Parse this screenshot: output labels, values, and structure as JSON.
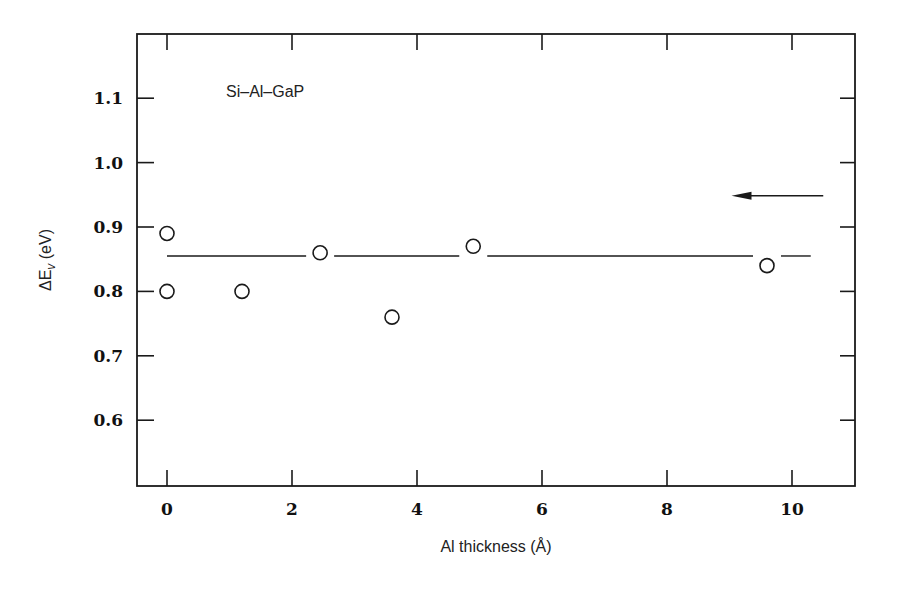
{
  "chart_data": {
    "type": "scatter",
    "title": "",
    "annotation": "Si–Al–GaP",
    "xlabel": "Al thickness (Å)",
    "ylabel_prefix": "ΔE",
    "ylabel_sub": "v",
    "ylabel_suffix": " (eV)",
    "xlim": [
      -0.5,
      11.0
    ],
    "ylim": [
      0.5,
      1.2
    ],
    "x_ticks": [
      0,
      2,
      4,
      6,
      8,
      10
    ],
    "x_tick_labels": [
      "0",
      "2",
      "4",
      "6",
      "8",
      "10"
    ],
    "y_ticks": [
      0.6,
      0.7,
      0.8,
      0.9,
      1.0,
      1.1
    ],
    "y_tick_labels": [
      "0.6",
      "0.7",
      "0.8",
      "0.9",
      "1.0",
      "1.1"
    ],
    "grid": false,
    "legend": null,
    "series": [
      {
        "name": "Si-Al-GaP",
        "marker": "open-circle",
        "x": [
          0.0,
          0.0,
          1.2,
          2.45,
          3.6,
          4.9,
          9.6
        ],
        "y": [
          0.89,
          0.8,
          0.8,
          0.86,
          0.76,
          0.87,
          0.84
        ]
      }
    ],
    "reference_line": {
      "type": "horizontal",
      "y": 0.855,
      "x_range": [
        0.0,
        10.3
      ],
      "style": "solid, broken around markers"
    },
    "arrow": {
      "direction": "left",
      "y": 0.95,
      "x_from": 10.5,
      "x_to": 9.0
    }
  }
}
